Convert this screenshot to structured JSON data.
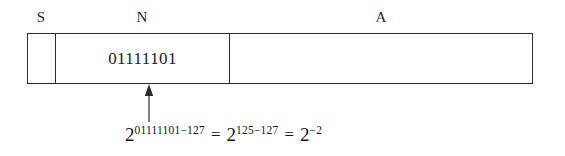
{
  "diagram": {
    "fields": [
      {
        "key": "sign",
        "label": "S",
        "value": ""
      },
      {
        "key": "exponent",
        "label": "N",
        "value": "01111101"
      },
      {
        "key": "mantissa",
        "label": "A",
        "value": ""
      }
    ],
    "labels": {
      "sign": "S",
      "exponent": "N",
      "mantissa": "A"
    },
    "exponent_bits": "01111101",
    "callout": {
      "arrow": "up-arrow",
      "points_to": "exponent"
    },
    "formula": {
      "base1": "2",
      "exp1": "01111101−127",
      "equals1": "=",
      "base2": "2",
      "exp2": "125−127",
      "equals2": "=",
      "base3": "2",
      "exp3": "−2",
      "plain": "2^(01111101−127) = 2^(125−127) = 2^(−2)"
    },
    "colors": {
      "background": "#ffffff",
      "stroke": "#2b2b2b",
      "text": "#1a1a1a"
    }
  }
}
